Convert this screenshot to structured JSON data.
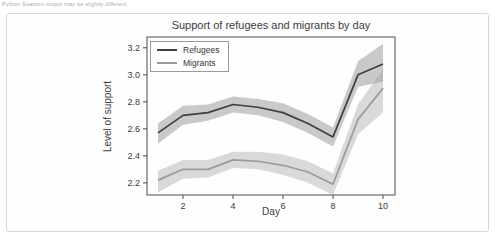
{
  "page": {
    "caption": "Python Seaborn output may be slightly different"
  },
  "chart_data": {
    "type": "line",
    "title": "Support of refugees and migrants by day",
    "xlabel": "Day",
    "ylabel": "Level of support",
    "x": [
      1,
      2,
      3,
      4,
      5,
      6,
      7,
      8,
      9,
      10
    ],
    "xticks": [
      2,
      4,
      6,
      8,
      10
    ],
    "yticks": [
      2.2,
      2.4,
      2.6,
      2.8,
      3.0,
      3.2
    ],
    "xlim": [
      0.56,
      10.48
    ],
    "ylim": [
      2.11,
      3.28
    ],
    "grid": false,
    "legend_position": "upper left",
    "series": [
      {
        "name": "Refugees",
        "color": "#3f3f3f",
        "band_color": "rgba(80,80,80,0.30)",
        "values": [
          2.57,
          2.7,
          2.72,
          2.78,
          2.76,
          2.72,
          2.64,
          2.54,
          3.0,
          3.08
        ],
        "ci_low": [
          2.49,
          2.63,
          2.66,
          2.72,
          2.7,
          2.65,
          2.57,
          2.47,
          2.91,
          2.95
        ],
        "ci_high": [
          2.64,
          2.77,
          2.78,
          2.84,
          2.82,
          2.79,
          2.71,
          2.61,
          3.1,
          3.23
        ]
      },
      {
        "name": "Migrants",
        "color": "#9b9b9b",
        "band_color": "rgba(150,150,150,0.35)",
        "values": [
          2.22,
          2.3,
          2.3,
          2.37,
          2.36,
          2.33,
          2.28,
          2.19,
          2.67,
          2.9
        ],
        "ci_low": [
          2.13,
          2.23,
          2.24,
          2.31,
          2.3,
          2.26,
          2.2,
          2.11,
          2.56,
          2.72
        ],
        "ci_high": [
          2.29,
          2.37,
          2.37,
          2.43,
          2.43,
          2.41,
          2.36,
          2.27,
          2.78,
          3.04
        ]
      }
    ]
  },
  "colors": {
    "axes": "#4a4a4a",
    "tick_text": "#3c3c3c",
    "frame_border": "#d7d7d7",
    "background": "#ffffff"
  }
}
